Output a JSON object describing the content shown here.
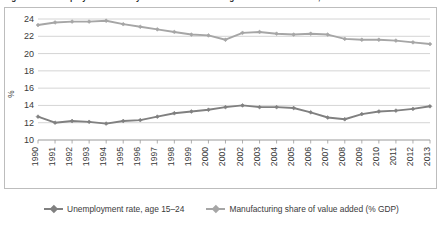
{
  "figure": {
    "title": "Figure 2.4. Unemployment rate of youth and manufacturing share of value added, 1990-2013"
  },
  "legend": {
    "position": "bottom",
    "entries": [
      {
        "label": "Unemployment rate, age 15–24",
        "color": "#808080",
        "marker": "diamond"
      },
      {
        "label": "Manufacturing share of value added (% GDP)",
        "color": "#a6a6a6",
        "marker": "diamond"
      }
    ]
  },
  "chart_data": {
    "type": "line",
    "title": "Figure 2.4. Unemployment rate of youth and manufacturing share of value added, 1990-2013",
    "xlabel": "",
    "ylabel": "%",
    "ylim": [
      10,
      24
    ],
    "yticks": [
      10,
      12,
      14,
      16,
      18,
      20,
      22,
      24
    ],
    "grid": true,
    "x": [
      1990,
      1991,
      1992,
      1993,
      1994,
      1995,
      1996,
      1997,
      1998,
      1999,
      2000,
      2001,
      2002,
      2003,
      2004,
      2005,
      2006,
      2007,
      2008,
      2009,
      2010,
      2011,
      2012,
      2013
    ],
    "xticklabels": [
      "1990",
      "1991",
      "1992",
      "1993",
      "1994",
      "1995",
      "1996",
      "1997",
      "1998",
      "1999",
      "2000",
      "2001",
      "2002",
      "2003",
      "2004",
      "2005",
      "2006",
      "2007",
      "2008",
      "2009",
      "2010",
      "2011",
      "2012",
      "2013"
    ],
    "series": [
      {
        "name": "Unemployment rate, age 15–24",
        "color": "#808080",
        "values": [
          12.7,
          12.0,
          12.2,
          12.1,
          11.9,
          12.2,
          12.3,
          12.7,
          13.1,
          13.3,
          13.5,
          13.8,
          14.0,
          13.8,
          13.8,
          13.7,
          13.2,
          12.6,
          12.4,
          13.0,
          13.3,
          13.4,
          13.6,
          13.9
        ]
      },
      {
        "name": "Manufacturing share of value added (% GDP)",
        "color": "#a6a6a6",
        "values": [
          23.3,
          23.6,
          23.7,
          23.7,
          23.8,
          23.4,
          23.1,
          22.8,
          22.5,
          22.2,
          22.1,
          21.6,
          22.4,
          22.5,
          22.3,
          22.2,
          22.3,
          22.2,
          21.7,
          21.6,
          21.6,
          21.5,
          21.3,
          21.1
        ]
      }
    ]
  }
}
